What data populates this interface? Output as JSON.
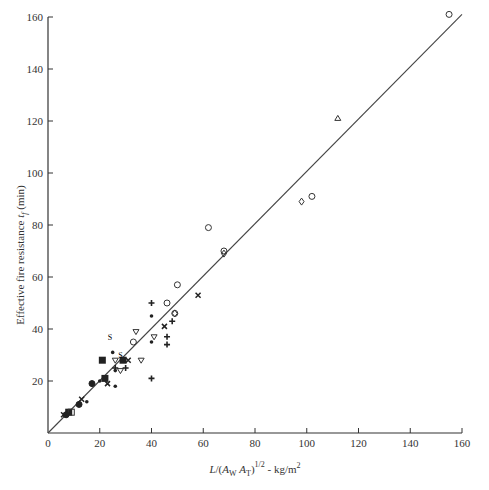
{
  "chart_data": {
    "type": "scatter",
    "title": "",
    "xlabel": "L/(A_W A_T)^1/2 - kg/m2",
    "ylabel": "Effective fire resistance t_f (min)",
    "xlim": [
      0,
      160
    ],
    "ylim": [
      0,
      160
    ],
    "xticks": [
      "0",
      "20",
      "40",
      "60",
      "80",
      "100",
      "120",
      "140",
      "160"
    ],
    "yticks": [
      "20",
      "40",
      "60",
      "80",
      "100",
      "120",
      "140",
      "160"
    ],
    "grid": false,
    "legend": null,
    "fit_line": {
      "x": [
        0,
        160
      ],
      "y": [
        0,
        161
      ]
    },
    "series": [
      {
        "name": "open-circle",
        "marker": "circle-open",
        "points": [
          [
            155,
            161
          ],
          [
            102,
            91
          ],
          [
            62,
            79
          ],
          [
            50,
            57
          ],
          [
            46,
            50
          ],
          [
            33,
            35
          ],
          [
            49,
            46
          ],
          [
            68,
            70
          ]
        ]
      },
      {
        "name": "open-diamond",
        "marker": "diamond-open",
        "points": [
          [
            98,
            89
          ],
          [
            68,
            69
          ],
          [
            49,
            46
          ]
        ]
      },
      {
        "name": "open-triangle",
        "marker": "triangle-open",
        "points": [
          [
            112,
            121
          ]
        ]
      },
      {
        "name": "inverted-triangle",
        "marker": "triangle-down-open",
        "points": [
          [
            34,
            39
          ],
          [
            41,
            37
          ],
          [
            36,
            28
          ],
          [
            26,
            28
          ],
          [
            28,
            24
          ]
        ]
      },
      {
        "name": "filled-square",
        "marker": "square-filled",
        "points": [
          [
            21,
            28
          ],
          [
            29,
            28
          ],
          [
            22,
            21
          ],
          [
            8,
            8
          ]
        ]
      },
      {
        "name": "open-square",
        "marker": "square-open",
        "points": [
          [
            9,
            8
          ]
        ]
      },
      {
        "name": "filled-dot",
        "marker": "dot",
        "points": [
          [
            40,
            45
          ],
          [
            40,
            35
          ],
          [
            26,
            24
          ],
          [
            26,
            18
          ],
          [
            25,
            31
          ],
          [
            15,
            12
          ],
          [
            20,
            20
          ]
        ]
      },
      {
        "name": "plus",
        "marker": "plus",
        "points": [
          [
            40,
            50
          ],
          [
            40,
            21
          ],
          [
            46,
            37
          ],
          [
            46,
            34
          ],
          [
            48,
            43
          ],
          [
            26,
            25
          ],
          [
            30,
            25
          ]
        ]
      },
      {
        "name": "cross",
        "marker": "cross",
        "points": [
          [
            58,
            53
          ],
          [
            45,
            41
          ],
          [
            31,
            28
          ],
          [
            23,
            19
          ],
          [
            13,
            13
          ],
          [
            6,
            7
          ]
        ]
      },
      {
        "name": "half-filled",
        "marker": "half",
        "points": [
          [
            17,
            19
          ],
          [
            7,
            7
          ],
          [
            12,
            11
          ]
        ]
      },
      {
        "name": "s-symbol",
        "marker": "s",
        "points": [
          [
            24,
            37
          ],
          [
            28,
            30
          ]
        ]
      }
    ]
  },
  "labels": {
    "x_axis": "L/(A",
    "y_axis": "Effective fire resistance t"
  }
}
